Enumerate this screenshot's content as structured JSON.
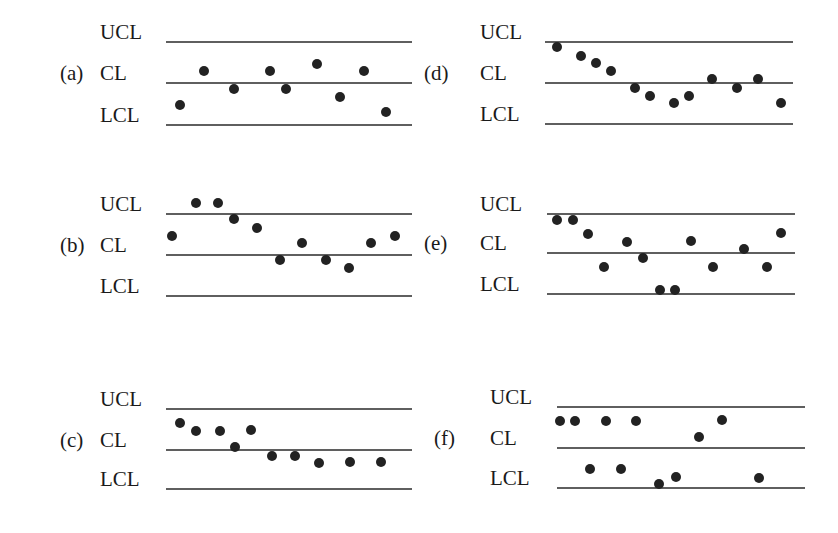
{
  "figure": {
    "line_color": "#2a2a2a",
    "point_color": "#222222",
    "label_color": "#1a1a1a",
    "line_labels": {
      "ucl": "UCL",
      "cl": "CL",
      "lcl": "LCL"
    }
  },
  "chart_data": [
    {
      "type": "scatter",
      "title": "(a)",
      "id": "a",
      "description": "Points scattered randomly around the center line, within limits",
      "layout": {
        "tag_x": 60,
        "label_x": 100,
        "line_x1": 166,
        "line_x2": 412,
        "ucl_y": 42,
        "cl_y": 83,
        "lcl_y": 125,
        "tag_row": "cl"
      },
      "points": [
        [
          180,
          105
        ],
        [
          204,
          71
        ],
        [
          234,
          89
        ],
        [
          270,
          71
        ],
        [
          286,
          89
        ],
        [
          317,
          64
        ],
        [
          340,
          97
        ],
        [
          364,
          71
        ],
        [
          386,
          112
        ]
      ]
    },
    {
      "type": "scatter",
      "title": "(b)",
      "id": "b",
      "description": "Points above the UCL and runs above the center line",
      "layout": {
        "tag_x": 60,
        "label_x": 100,
        "line_x1": 166,
        "line_x2": 412,
        "ucl_y": 214,
        "cl_y": 255,
        "lcl_y": 296,
        "tag_row": "cl"
      },
      "points": [
        [
          172,
          236
        ],
        [
          196,
          203
        ],
        [
          218,
          203
        ],
        [
          234,
          219
        ],
        [
          257,
          228
        ],
        [
          280,
          260
        ],
        [
          302,
          243
        ],
        [
          326,
          260
        ],
        [
          349,
          268
        ],
        [
          371,
          243
        ],
        [
          395,
          236
        ]
      ]
    },
    {
      "type": "scatter",
      "title": "(c)",
      "id": "c",
      "description": "Shift in process level: run above then run below center line",
      "layout": {
        "tag_x": 60,
        "label_x": 100,
        "line_x1": 166,
        "line_x2": 412,
        "ucl_y": 409,
        "cl_y": 450,
        "lcl_y": 489,
        "tag_row": "cl"
      },
      "points": [
        [
          180,
          423
        ],
        [
          196,
          431
        ],
        [
          220,
          431
        ],
        [
          235,
          447
        ],
        [
          251,
          430
        ],
        [
          272,
          456
        ],
        [
          295,
          456
        ],
        [
          319,
          463
        ],
        [
          350,
          462
        ],
        [
          381,
          462
        ]
      ]
    },
    {
      "type": "scatter",
      "title": "(d)",
      "id": "d",
      "description": "Downward trend from near UCL toward LCL",
      "layout": {
        "tag_x": 424,
        "label_x": 480,
        "line_x1": 545,
        "line_x2": 793,
        "ucl_y": 42,
        "cl_y": 83,
        "lcl_y": 124,
        "tag_row": "cl"
      },
      "points": [
        [
          557,
          47
        ],
        [
          581,
          56
        ],
        [
          596,
          63
        ],
        [
          611,
          71
        ],
        [
          635,
          88
        ],
        [
          650,
          96
        ],
        [
          674,
          103
        ],
        [
          689,
          96
        ],
        [
          712,
          79
        ],
        [
          737,
          88
        ],
        [
          758,
          79
        ],
        [
          781,
          103
        ]
      ]
    },
    {
      "type": "scatter",
      "title": "(e)",
      "id": "e",
      "description": "Points at both control limits, large oscillation",
      "layout": {
        "tag_x": 424,
        "label_x": 480,
        "line_x1": 547,
        "line_x2": 795,
        "ucl_y": 214,
        "cl_y": 253,
        "lcl_y": 294,
        "tag_row": "cl"
      },
      "points": [
        [
          557,
          220
        ],
        [
          573,
          220
        ],
        [
          588,
          234
        ],
        [
          604,
          267
        ],
        [
          627,
          242
        ],
        [
          643,
          258
        ],
        [
          660,
          290
        ],
        [
          675,
          290
        ],
        [
          691,
          241
        ],
        [
          713,
          267
        ],
        [
          744,
          249
        ],
        [
          767,
          267
        ],
        [
          781,
          233
        ]
      ]
    },
    {
      "type": "scatter",
      "title": "(f)",
      "id": "f",
      "description": "Points clustered near both limits, few near the center line",
      "layout": {
        "tag_x": 434,
        "label_x": 490,
        "line_x1": 557,
        "line_x2": 805,
        "ucl_y": 407,
        "cl_y": 448,
        "lcl_y": 488,
        "tag_row": "cl"
      },
      "points": [
        [
          560,
          421
        ],
        [
          575,
          421
        ],
        [
          606,
          421
        ],
        [
          636,
          421
        ],
        [
          722,
          420
        ],
        [
          699,
          437
        ],
        [
          590,
          469
        ],
        [
          621,
          469
        ],
        [
          659,
          484
        ],
        [
          676,
          477
        ],
        [
          759,
          478
        ]
      ]
    }
  ]
}
